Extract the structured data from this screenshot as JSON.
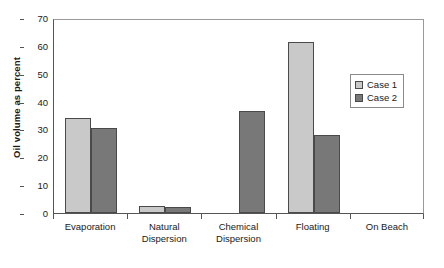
{
  "chart_data": {
    "type": "bar",
    "title": "",
    "xlabel": "",
    "ylabel": "Oil volume as percent",
    "ylim": [
      0,
      70
    ],
    "yticks": [
      0,
      10,
      20,
      30,
      40,
      50,
      60,
      70
    ],
    "grid": false,
    "legend_position": "inside-right",
    "categories": [
      "Evaporation",
      "Natural Dispersion",
      "Chemical Dispersion",
      "Floating",
      "On Beach"
    ],
    "category_lines": [
      [
        "Evaporation"
      ],
      [
        "Natural",
        "Dispersion"
      ],
      [
        "Chemical",
        "Dispersion"
      ],
      [
        "Floating"
      ],
      [
        "On Beach"
      ]
    ],
    "series": [
      {
        "name": "Case 1",
        "color": "#c9c9c9",
        "values": [
          34,
          2.5,
          0,
          61.5,
          0
        ]
      },
      {
        "name": "Case 2",
        "color": "#787878",
        "values": [
          30.5,
          2.3,
          36.5,
          28,
          0
        ]
      }
    ]
  },
  "legend": {
    "entries": [
      {
        "label": "Case 1"
      },
      {
        "label": "Case 2"
      }
    ]
  },
  "caption": {
    "text": ""
  },
  "colors": {
    "case1": "#c9c9c9",
    "case2": "#787878",
    "axis": "#555555",
    "frame": "#999999",
    "background": "#ffffff"
  }
}
